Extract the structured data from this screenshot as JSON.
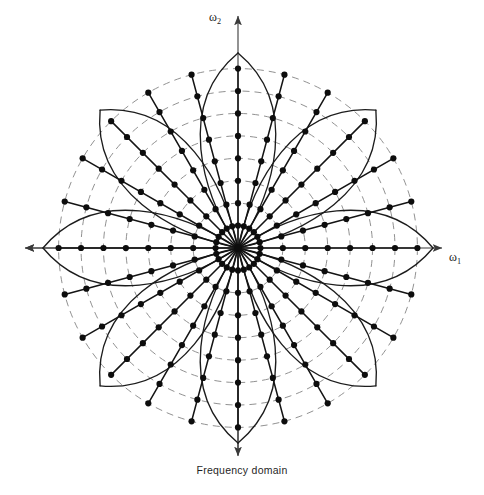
{
  "figure": {
    "caption": "Frequency domain",
    "axes": {
      "horizontal_label": "ω",
      "horizontal_subscript": "1",
      "vertical_label": "ω",
      "vertical_subscript": "2",
      "horizontal_label_full": "ω1",
      "vertical_label_full": "ω2"
    },
    "colors": {
      "background": "#ffffff",
      "petal_stroke": "#1c1c1c",
      "ring_stroke": "#7d7d7d",
      "spoke_stroke": "#141414",
      "dot_fill": "#0d0d0d",
      "axis_stroke": "#3a3a3a",
      "text": "#1a1a1a"
    }
  },
  "chart_data": {
    "type": "scatter",
    "title": "",
    "subtitle": "",
    "caption": "Frequency domain",
    "coordinate_system": "polar",
    "xlabel": "ω1",
    "ylabel": "ω2",
    "xlim": [
      -1.25,
      1.25
    ],
    "ylim": [
      -1.25,
      1.25
    ],
    "grid": "dashed concentric circles",
    "legend": "none",
    "center_px": [
      238,
      248
    ],
    "unit_radius_px": 195,
    "petal_count": 8,
    "petal_angles_deg": [
      0,
      45,
      90,
      135,
      180,
      225,
      270,
      315
    ],
    "petal_tip_radius": 1.0,
    "petal_half_width_deg": 33,
    "ring_count": 8,
    "ring_radii": [
      0.115,
      0.23,
      0.345,
      0.46,
      0.575,
      0.69,
      0.805,
      0.92
    ],
    "spoke_count": 24,
    "spoke_angles_deg": [
      0,
      15,
      30,
      45,
      60,
      75,
      90,
      105,
      120,
      135,
      150,
      165,
      180,
      195,
      210,
      225,
      240,
      255,
      270,
      285,
      300,
      315,
      330,
      345
    ],
    "samples_per_spoke": 8,
    "sample_radii": [
      0.115,
      0.23,
      0.345,
      0.46,
      0.575,
      0.69,
      0.805,
      0.92
    ],
    "dot_radius_px": 3.1,
    "axis_arrows": [
      "left",
      "right",
      "up",
      "down"
    ],
    "axis_extent_px": 213,
    "annotations": [
      {
        "text": "ω2",
        "position": "top of vertical axis"
      },
      {
        "text": "ω1",
        "position": "right of horizontal axis"
      },
      {
        "text": "Frequency domain",
        "position": "below figure, centered"
      }
    ]
  }
}
